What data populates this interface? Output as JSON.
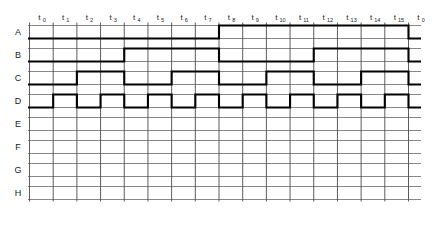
{
  "diagram": {
    "type": "digital-timing-waveform",
    "time_axis": {
      "label_prefix": "t",
      "tick_labels": [
        "t0",
        "t1",
        "t2",
        "t3",
        "t4",
        "t5",
        "t6",
        "t7",
        "t8",
        "t9",
        "t10",
        "t11",
        "t12",
        "t13",
        "t14",
        "t15",
        "t0"
      ],
      "tick_bases": [
        "t",
        "t",
        "t",
        "t",
        "t",
        "t",
        "t",
        "t",
        "t",
        "t",
        "t",
        "t",
        "t",
        "t",
        "t",
        "t",
        "t"
      ],
      "tick_subscripts": [
        "0",
        "1",
        "2",
        "3",
        "4",
        "5",
        "6",
        "7",
        "8",
        "9",
        "10",
        "11",
        "12",
        "13",
        "14",
        "15",
        "0"
      ],
      "slot_count": 16
    },
    "rows": [
      {
        "label": "A",
        "has_waveform": true,
        "levels": [
          0,
          0,
          0,
          0,
          0,
          0,
          0,
          0,
          1,
          1,
          1,
          1,
          1,
          1,
          1,
          1
        ],
        "period_slots": 16
      },
      {
        "label": "B",
        "has_waveform": true,
        "levels": [
          0,
          0,
          0,
          0,
          1,
          1,
          1,
          1,
          0,
          0,
          0,
          0,
          1,
          1,
          1,
          1
        ],
        "period_slots": 8
      },
      {
        "label": "C",
        "has_waveform": true,
        "levels": [
          0,
          0,
          1,
          1,
          0,
          0,
          1,
          1,
          0,
          0,
          1,
          1,
          0,
          0,
          1,
          1
        ],
        "period_slots": 4
      },
      {
        "label": "D",
        "has_waveform": true,
        "levels": [
          0,
          1,
          0,
          1,
          0,
          1,
          0,
          1,
          0,
          1,
          0,
          1,
          0,
          1,
          0,
          1
        ],
        "period_slots": 2
      },
      {
        "label": "E",
        "has_waveform": false,
        "levels": [],
        "period_slots": 0
      },
      {
        "label": "F",
        "has_waveform": false,
        "levels": [],
        "period_slots": 0
      },
      {
        "label": "G",
        "has_waveform": false,
        "levels": [],
        "period_slots": 0
      },
      {
        "label": "H",
        "has_waveform": false,
        "levels": [],
        "period_slots": 0
      }
    ],
    "colors": {
      "background": "#ffffff",
      "waveform": "#000000",
      "grid_vertical": "#4a4a4a",
      "grid_horizontal": "#7a7a7a",
      "text": "#1a1a1a"
    }
  }
}
